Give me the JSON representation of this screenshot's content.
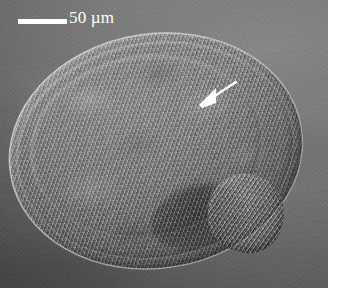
{
  "figure": {
    "kind": "dic-light-micrograph",
    "width_px": 337,
    "height_px": 299
  },
  "micrograph": {
    "content_width_px": 328,
    "content_height_px": 288,
    "background_color": "#6a6a6a",
    "specimen_fill": "#8a8a8a"
  },
  "annotations": {
    "scale_bar": {
      "label": "50 µm",
      "color": "#ffffff",
      "bar_length_px": 49,
      "bar_thickness_px": 5,
      "bar_x_px": 18,
      "bar_y_px": 19
    },
    "arrow": {
      "name": "pointer-arrow",
      "color": "#ffffff",
      "tip_x_px": 201,
      "tip_y_px": 104,
      "tail_x_px": 236,
      "tail_y_px": 82,
      "direction": "down-left"
    }
  }
}
